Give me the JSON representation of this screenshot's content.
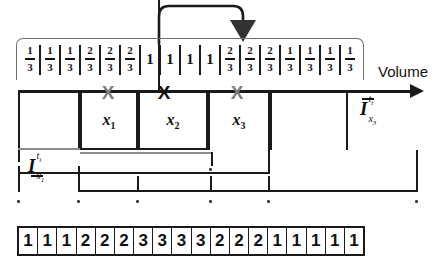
{
  "diagram": {
    "title_axis_label": "Volume",
    "fraction_strip": {
      "name": "volume-fraction-strip",
      "cells": [
        {
          "type": "fraction",
          "num": "1",
          "den": "3",
          "text": "1/3"
        },
        {
          "type": "fraction",
          "num": "1",
          "den": "3",
          "text": "1/3"
        },
        {
          "type": "fraction",
          "num": "1",
          "den": "3",
          "text": "1/3"
        },
        {
          "type": "fraction",
          "num": "2",
          "den": "3",
          "text": "2/3"
        },
        {
          "type": "fraction",
          "num": "2",
          "den": "3",
          "text": "2/3"
        },
        {
          "type": "fraction",
          "num": "2",
          "den": "3",
          "text": "2/3"
        },
        {
          "type": "whole",
          "text": "1"
        },
        {
          "type": "whole",
          "text": "1"
        },
        {
          "type": "whole",
          "text": "1"
        },
        {
          "type": "whole",
          "text": "1"
        },
        {
          "type": "fraction",
          "num": "2",
          "den": "3",
          "text": "2/3"
        },
        {
          "type": "fraction",
          "num": "2",
          "den": "3",
          "text": "2/3"
        },
        {
          "type": "fraction",
          "num": "2",
          "den": "3",
          "text": "2/3"
        },
        {
          "type": "fraction",
          "num": "1",
          "den": "3",
          "text": "1/3"
        },
        {
          "type": "fraction",
          "num": "1",
          "den": "3",
          "text": "1/3"
        },
        {
          "type": "fraction",
          "num": "1",
          "den": "3",
          "text": "1/3"
        },
        {
          "type": "fraction",
          "num": "1",
          "den": "3",
          "text": "1/3"
        }
      ]
    },
    "variable_boxes": [
      {
        "name": "box-x1",
        "label": "x",
        "subscript": "1"
      },
      {
        "name": "box-x2",
        "label": "x",
        "subscript": "2"
      },
      {
        "name": "box-x3",
        "label": "x",
        "subscript": "3"
      }
    ],
    "x_markers": [
      {
        "name": "x-marker-1",
        "glyph": "X",
        "color": "#7d7d7d"
      },
      {
        "name": "x-marker-2",
        "glyph": "X",
        "color": "#141414"
      },
      {
        "name": "x-marker-3",
        "glyph": "X",
        "color": "#7d7d7d"
      }
    ],
    "interval_labels": {
      "lower_x1": {
        "symbol": "I",
        "superscript": "t",
        "superscript_sub": "i",
        "subscript": "x",
        "subscript_sub": "1",
        "bar": "under",
        "text": "I_x1^ti (lower)"
      },
      "upper_x3": {
        "symbol": "I",
        "superscript": "t",
        "superscript_sub": "i",
        "subscript": "x",
        "subscript_sub": "3",
        "bar": "over",
        "text": "I_x3^ti (upper)"
      }
    },
    "feedback_arrow": {
      "name": "feedback-arrow",
      "direction": "down"
    },
    "bottom_strip": {
      "name": "discrete-value-strip",
      "cells": [
        "1",
        "1",
        "1",
        "2",
        "2",
        "2",
        "3",
        "3",
        "3",
        "3",
        "2",
        "2",
        "2",
        "1",
        "1",
        "1",
        "1",
        "1"
      ]
    },
    "colors": {
      "ink": "#1a1a1a",
      "gray_marker": "#7d7d7d",
      "bracket": "#6f6f6f"
    }
  }
}
